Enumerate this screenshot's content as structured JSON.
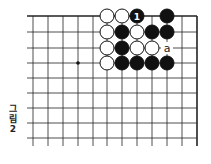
{
  "caption": {
    "line1": "그",
    "line2": "림",
    "line3": "2"
  },
  "board": {
    "grid_x": [
      33,
      48,
      63,
      78,
      93,
      107,
      122,
      137,
      152,
      167,
      182,
      197
    ],
    "grid_y": [
      16,
      32,
      48,
      63,
      78,
      93,
      108,
      123,
      138
    ],
    "star_points": [
      [
        3,
        3
      ]
    ],
    "stones": [
      {
        "col": 5,
        "row": 0,
        "color": "white"
      },
      {
        "col": 6,
        "row": 0,
        "color": "white"
      },
      {
        "col": 7,
        "row": 0,
        "color": "black",
        "label": "1"
      },
      {
        "col": 9,
        "row": 0,
        "color": "black"
      },
      {
        "col": 5,
        "row": 1,
        "color": "white"
      },
      {
        "col": 6,
        "row": 1,
        "color": "black"
      },
      {
        "col": 7,
        "row": 1,
        "color": "white"
      },
      {
        "col": 8,
        "row": 1,
        "color": "black"
      },
      {
        "col": 9,
        "row": 1,
        "color": "black"
      },
      {
        "col": 5,
        "row": 2,
        "color": "white"
      },
      {
        "col": 6,
        "row": 2,
        "color": "black"
      },
      {
        "col": 7,
        "row": 2,
        "color": "white"
      },
      {
        "col": 8,
        "row": 2,
        "color": "white"
      },
      {
        "col": 5,
        "row": 3,
        "color": "white"
      },
      {
        "col": 6,
        "row": 3,
        "color": "black"
      },
      {
        "col": 7,
        "row": 3,
        "color": "black"
      },
      {
        "col": 8,
        "row": 3,
        "color": "black"
      },
      {
        "col": 9,
        "row": 3,
        "color": "black"
      }
    ],
    "labels": [
      {
        "col": 9,
        "row": 2,
        "text": "a"
      }
    ]
  }
}
